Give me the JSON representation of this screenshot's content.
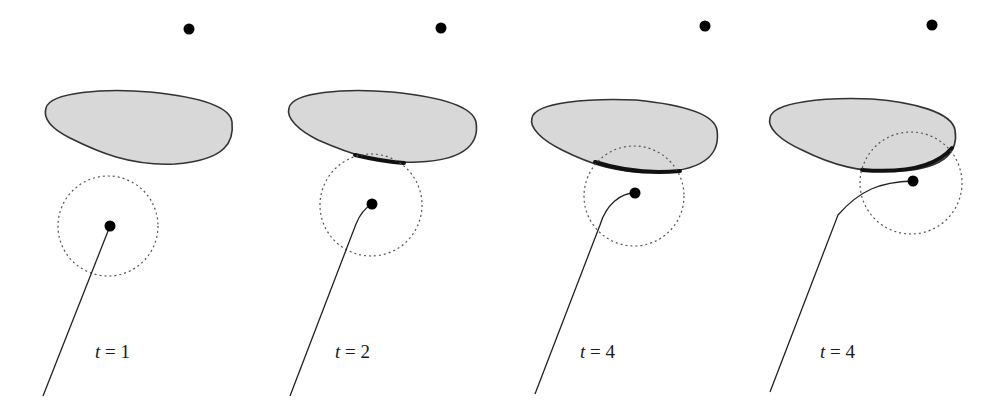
{
  "figure": {
    "colors": {
      "background": "#ffffff",
      "obstacle_fill": "#d8d8d8",
      "obstacle_stroke": "#333333",
      "contact_segment": "#111111",
      "sensor_circle": "#555555",
      "path": "#222222",
      "points": "#000000"
    },
    "panels": [
      {
        "label_var": "t",
        "label_eq": " = ",
        "label_val": "1",
        "goal": {
          "x": 189,
          "y": 29
        },
        "robot": {
          "x": 110,
          "y": 226
        },
        "sensor_circle": {
          "cx": 108,
          "cy": 226,
          "r": 50
        },
        "obstacle_path": "M 46 108 C 50 92, 105 88, 150 92 C 190 96, 230 104, 232 122 C 234 140, 228 160, 175 164 C 130 166, 98 152, 70 138 C 50 128, 43 118, 46 108 Z",
        "contact_path": "",
        "robot_path": "M 110 226 L 43 396",
        "label_pos": {
          "x": 95,
          "y": 358
        }
      },
      {
        "label_var": "t",
        "label_eq": " = ",
        "label_val": "2",
        "goal": {
          "x": 441,
          "y": 28
        },
        "robot": {
          "x": 372,
          "y": 204
        },
        "sensor_circle": {
          "cx": 371,
          "cy": 205,
          "r": 51
        },
        "obstacle_path": "M 289 108 C 292 92, 345 88, 392 92 C 432 96, 472 104, 476 122 C 479 140, 470 160, 418 162 C 378 164, 350 154, 318 140 C 298 130, 286 118, 289 108 Z",
        "contact_path": "M 355 155 C 372 159, 388 162, 404 163",
        "robot_path": "M 372 204 C 365 208, 360 214, 356 224 L 290 396",
        "label_pos": {
          "x": 335,
          "y": 358
        }
      },
      {
        "label_var": "t",
        "label_eq": " = ",
        "label_val": "4",
        "goal": {
          "x": 705,
          "y": 26
        },
        "robot": {
          "x": 635,
          "y": 193
        },
        "sensor_circle": {
          "cx": 634,
          "cy": 196,
          "r": 50
        },
        "obstacle_path": "M 532 118 C 535 102, 590 98, 636 100 C 676 104, 714 112, 717 130 C 720 150, 710 170, 660 172 C 618 174, 590 164, 562 150 C 542 140, 529 128, 532 118 Z",
        "contact_path": "M 595 162 C 620 170, 650 174, 680 171",
        "robot_path": "M 635 193 C 620 193, 606 205, 600 225 L 535 394",
        "label_pos": {
          "x": 580,
          "y": 358
        }
      },
      {
        "label_var": "t",
        "label_eq": " = ",
        "label_val": "4",
        "goal": {
          "x": 932,
          "y": 25
        },
        "robot": {
          "x": 913,
          "y": 181
        },
        "sensor_circle": {
          "cx": 911,
          "cy": 183,
          "r": 51
        },
        "obstacle_path": "M 770 118 C 772 102, 825 97, 872 99 C 912 102, 952 112, 955 130 C 958 148, 950 168, 900 171 C 860 173, 832 165, 802 150 C 780 140, 767 128, 770 118 Z",
        "contact_path": "M 862 170 C 900 173, 935 168, 952 148",
        "robot_path": "M 913 181 C 880 182, 860 190, 838 215 L 770 392",
        "label_pos": {
          "x": 820,
          "y": 358
        }
      }
    ]
  }
}
